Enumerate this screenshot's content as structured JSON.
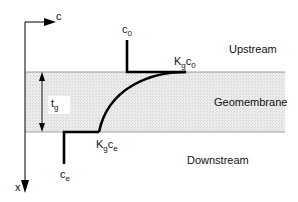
{
  "diagram": {
    "axes": {
      "horizontal_label": "c",
      "vertical_label": "x"
    },
    "regions": {
      "upstream": "Upstream",
      "membrane": "Geomembrane",
      "downstream": "Downstream"
    },
    "thickness_label": {
      "main": "t",
      "sub": "g"
    },
    "concentrations": {
      "upstream_source": {
        "main": "c",
        "sub": "0"
      },
      "upstream_interface": {
        "k": "K",
        "k_sub": "g",
        "c": "c",
        "c_sub": "0"
      },
      "downstream_interface": {
        "k": "K",
        "k_sub": "g",
        "c": "c",
        "c_sub": "e"
      },
      "downstream_source": {
        "main": "c",
        "sub": "e"
      }
    },
    "colors": {
      "membrane_fill": "#e6e6e6",
      "line": "#000000",
      "membrane_border": "#8a8a8a"
    }
  }
}
